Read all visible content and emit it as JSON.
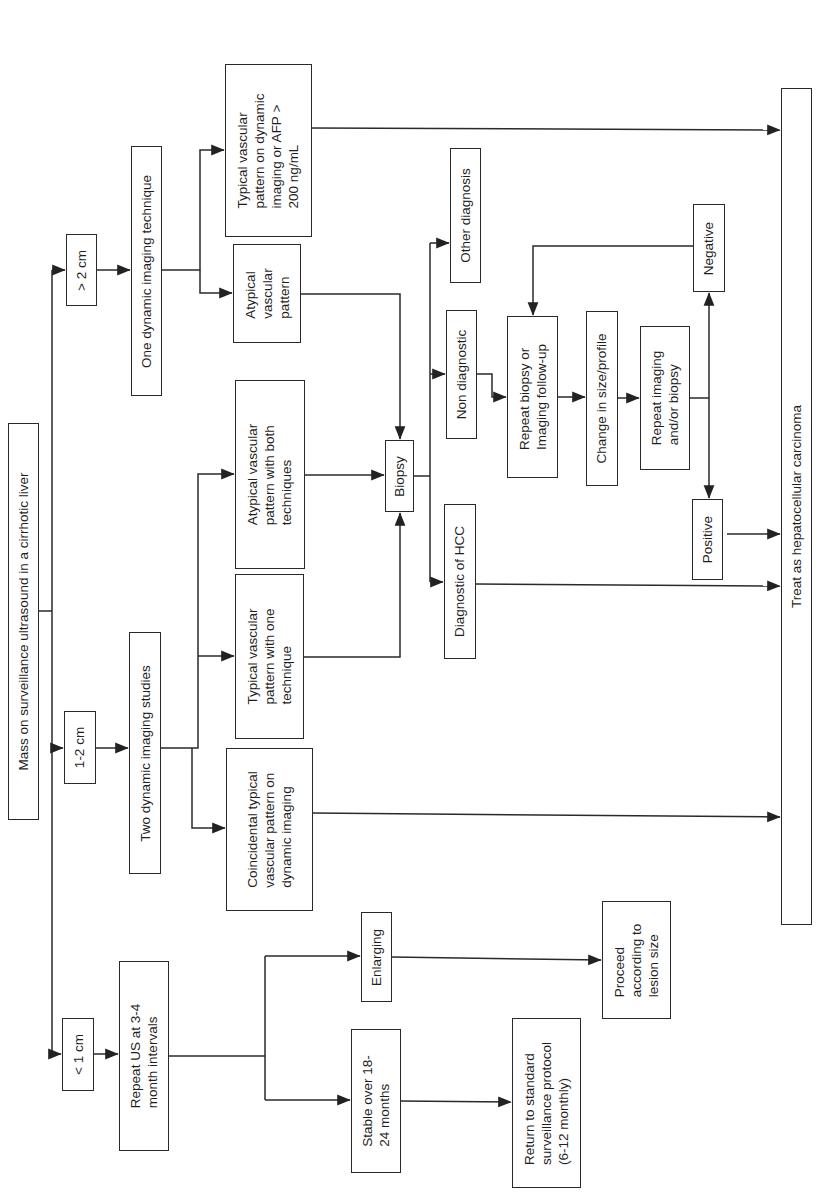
{
  "diagram": {
    "orientation": "rotated-90-ccw",
    "line_color": "#2a2a2a",
    "nodes": {
      "root": {
        "label": "Mass on surveillance ultrasound in a cirrhotic liver"
      },
      "gt2cm": {
        "label": "> 2 cm"
      },
      "one_dynamic": {
        "label": "One dynamic imaging technique"
      },
      "typical_afp": {
        "label": "Typical vascular\npattern on dynamic\nimaging or AFP >\n200 ng/mL"
      },
      "atypical_single": {
        "label": "Atypical\nvascular\npattern"
      },
      "cm1_2": {
        "label": "1-2 cm"
      },
      "two_dynamic": {
        "label": "Two dynamic imaging studies"
      },
      "atypical_both": {
        "label": "Atypical vascular\npattern with both\ntechniques"
      },
      "typical_one": {
        "label": "Typical vascular\npattern with one\ntechnique"
      },
      "coincidental": {
        "label": "Coincidental typical\nvascular pattern on\ndynamic imaging"
      },
      "biopsy": {
        "label": "Biopsy"
      },
      "non_diagnostic": {
        "label": "Non diagnostic"
      },
      "other_diagnosis": {
        "label": "Other diagnosis"
      },
      "diagnostic_hcc": {
        "label": "Diagnostic of HCC"
      },
      "repeat_biopsy": {
        "label": "Repeat biopsy or\nImaging follow-up"
      },
      "change_size": {
        "label": "Change in size/profile"
      },
      "repeat_imaging": {
        "label": "Repeat imaging\nand/or biopsy"
      },
      "negative": {
        "label": "Negative"
      },
      "positive": {
        "label": "Positive"
      },
      "treat_hcc": {
        "label": "Treat as hepatocellular carcinoma"
      },
      "lt1cm": {
        "label": "< 1 cm"
      },
      "repeat_us": {
        "label": "Repeat US at 3-4\nmonth intervals"
      },
      "enlarging": {
        "label": "Enlarging"
      },
      "stable": {
        "label": "Stable over 18-\n24 months"
      },
      "proceed": {
        "label": "Proceed\naccording to\nlesion size"
      },
      "return_std": {
        "label": "Return to standard\nsurveillance protocol\n(6-12 monthly)"
      }
    },
    "edges": [
      {
        "from": "root",
        "to": "gt2cm"
      },
      {
        "from": "root",
        "to": "cm1_2"
      },
      {
        "from": "root",
        "to": "lt1cm"
      },
      {
        "from": "gt2cm",
        "to": "one_dynamic"
      },
      {
        "from": "one_dynamic",
        "to": "typical_afp"
      },
      {
        "from": "one_dynamic",
        "to": "atypical_single"
      },
      {
        "from": "typical_afp",
        "to": "treat_hcc"
      },
      {
        "from": "atypical_single",
        "to": "biopsy"
      },
      {
        "from": "cm1_2",
        "to": "two_dynamic"
      },
      {
        "from": "two_dynamic",
        "to": "atypical_both"
      },
      {
        "from": "two_dynamic",
        "to": "typical_one"
      },
      {
        "from": "two_dynamic",
        "to": "coincidental"
      },
      {
        "from": "atypical_both",
        "to": "biopsy"
      },
      {
        "from": "typical_one",
        "to": "biopsy"
      },
      {
        "from": "coincidental",
        "to": "treat_hcc"
      },
      {
        "from": "biopsy",
        "to": "other_diagnosis"
      },
      {
        "from": "biopsy",
        "to": "non_diagnostic"
      },
      {
        "from": "biopsy",
        "to": "diagnostic_hcc"
      },
      {
        "from": "diagnostic_hcc",
        "to": "treat_hcc"
      },
      {
        "from": "non_diagnostic",
        "to": "repeat_biopsy"
      },
      {
        "from": "repeat_biopsy",
        "to": "change_size"
      },
      {
        "from": "change_size",
        "to": "repeat_imaging"
      },
      {
        "from": "repeat_imaging",
        "to": "negative"
      },
      {
        "from": "repeat_imaging",
        "to": "positive"
      },
      {
        "from": "negative",
        "to": "repeat_biopsy"
      },
      {
        "from": "positive",
        "to": "treat_hcc"
      },
      {
        "from": "lt1cm",
        "to": "repeat_us"
      },
      {
        "from": "repeat_us",
        "to": "enlarging"
      },
      {
        "from": "repeat_us",
        "to": "stable"
      },
      {
        "from": "enlarging",
        "to": "proceed"
      },
      {
        "from": "stable",
        "to": "return_std"
      }
    ]
  }
}
